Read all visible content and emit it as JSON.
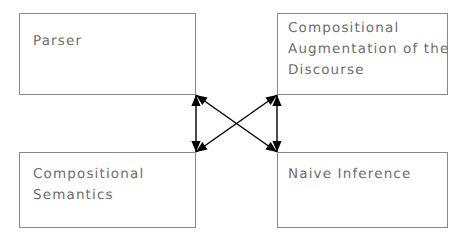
{
  "diagram": {
    "background_color": "#ffffff",
    "box_border_color": "#8a8a8a",
    "text_color": "#6e6e6e",
    "arrow_color": "#000000",
    "nodes": [
      {
        "id": "parser",
        "label": "Parser",
        "position": "top-left",
        "x": 19,
        "y": 13,
        "width": 177,
        "height": 82,
        "label_x": 33,
        "label_y": 31
      },
      {
        "id": "compositional-augmentation",
        "label": "Compositional\nAugmentation of the\nDiscourse",
        "position": "top-right",
        "x": 277,
        "y": 13,
        "width": 171,
        "height": 82,
        "label_x": 288,
        "label_y": 18
      },
      {
        "id": "compositional-semantics",
        "label": "Compositional\nSemantics",
        "position": "bottom-left",
        "x": 19,
        "y": 152,
        "width": 177,
        "height": 76,
        "label_x": 33,
        "label_y": 164
      },
      {
        "id": "naive-inference",
        "label": "Naive Inference",
        "position": "bottom-right",
        "x": 277,
        "y": 152,
        "width": 171,
        "height": 76,
        "label_x": 288,
        "label_y": 164
      }
    ],
    "connectors": [
      {
        "id": "left-vertical",
        "kind": "double-headed-arrow",
        "from": "parser",
        "to": "compositional-semantics",
        "x1": 196,
        "y1": 95,
        "x2": 196,
        "y2": 152
      },
      {
        "id": "right-vertical",
        "kind": "double-headed-arrow",
        "from": "compositional-augmentation",
        "to": "naive-inference",
        "x1": 277,
        "y1": 95,
        "x2": 277,
        "y2": 152
      },
      {
        "id": "diagonal-parser-to-naive-inference",
        "kind": "double-headed-arrow",
        "from": "parser",
        "to": "naive-inference",
        "x1": 196,
        "y1": 95,
        "x2": 277,
        "y2": 152
      },
      {
        "id": "diagonal-semantics-to-augmentation",
        "kind": "double-headed-arrow",
        "from": "compositional-semantics",
        "to": "compositional-augmentation",
        "x1": 196,
        "y1": 152,
        "x2": 277,
        "y2": 95
      }
    ]
  }
}
